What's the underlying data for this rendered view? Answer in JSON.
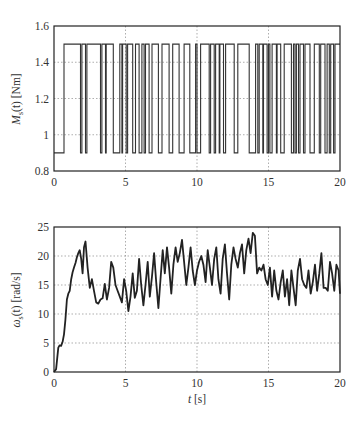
{
  "chart_data": [
    {
      "type": "line",
      "subtype": "step",
      "title": "",
      "xlabel": "",
      "ylabel": "M_s(t) [Nm]",
      "ylabel_parts": {
        "main": "M",
        "sub": "s",
        "arg": "(t)",
        "unit": " [Nm]"
      },
      "xlim": [
        0,
        20
      ],
      "ylim": [
        0.8,
        1.6
      ],
      "xticks": [
        0,
        5,
        10,
        15,
        20
      ],
      "yticks": [
        0.8,
        1,
        1.2,
        1.4,
        1.6
      ],
      "ytick_labels": [
        "0.8",
        "1",
        "1.2",
        "1.4",
        "1.6"
      ],
      "grid": true,
      "low_value": 0.9,
      "high_value": 1.5,
      "initial_value": 0.9,
      "switch_times": [
        0.7,
        1.85,
        1.95,
        2.2,
        2.3,
        3.25,
        3.35,
        3.6,
        3.65,
        4.15,
        4.6,
        4.75,
        4.8,
        5.05,
        5.15,
        5.5,
        5.7,
        5.95,
        6.15,
        6.3,
        6.4,
        6.65,
        6.85,
        7.3,
        7.55,
        8.05,
        8.3,
        8.75,
        9.1,
        9.5,
        9.9,
        10.0,
        10.25,
        10.85,
        10.95,
        11.2,
        11.3,
        11.55,
        11.6,
        11.85,
        12.0,
        12.6,
        12.85,
        13.65,
        14.1,
        14.25,
        14.35,
        14.6,
        14.65,
        14.9,
        15.0,
        15.1,
        15.25,
        15.55,
        15.6,
        15.85,
        16.1,
        16.6,
        16.75,
        16.85,
        16.95,
        17.1,
        17.2,
        17.45,
        17.55,
        17.9,
        18.2,
        18.55,
        18.65,
        18.95,
        19.1,
        19.25,
        19.35,
        19.55,
        19.65,
        20.0
      ]
    },
    {
      "type": "line",
      "title": "",
      "xlabel": "t [s]",
      "xlabel_parts": {
        "var": "t",
        "unit": " [s]"
      },
      "ylabel": "ω_s(t) [rad/s]",
      "ylabel_parts": {
        "main": "ω",
        "sub": "s",
        "arg": "(t)",
        "unit": " [rad/s]"
      },
      "xlim": [
        0,
        20
      ],
      "ylim": [
        0,
        25
      ],
      "xticks": [
        0,
        5,
        10,
        15,
        20
      ],
      "yticks": [
        0,
        5,
        10,
        15,
        20,
        25
      ],
      "ytick_labels": [
        "0",
        "5",
        "10",
        "15",
        "20",
        "25"
      ],
      "grid": true,
      "x": [
        0,
        0.15,
        0.3,
        0.4,
        0.5,
        0.6,
        0.7,
        0.8,
        0.9,
        1.0,
        1.1,
        1.2,
        1.3,
        1.4,
        1.5,
        1.6,
        1.7,
        1.8,
        1.9,
        2.0,
        2.1,
        2.2,
        2.35,
        2.5,
        2.65,
        2.8,
        2.95,
        3.1,
        3.25,
        3.4,
        3.55,
        3.7,
        3.85,
        4.0,
        4.15,
        4.3,
        4.45,
        4.6,
        4.75,
        4.9,
        5.05,
        5.2,
        5.35,
        5.5,
        5.65,
        5.8,
        5.95,
        6.1,
        6.25,
        6.4,
        6.55,
        6.7,
        6.85,
        7.0,
        7.15,
        7.3,
        7.45,
        7.6,
        7.75,
        7.9,
        8.05,
        8.2,
        8.35,
        8.5,
        8.65,
        8.8,
        8.95,
        9.1,
        9.25,
        9.4,
        9.55,
        9.7,
        9.85,
        10.0,
        10.15,
        10.3,
        10.45,
        10.6,
        10.75,
        10.9,
        11.05,
        11.2,
        11.35,
        11.5,
        11.65,
        11.8,
        11.95,
        12.1,
        12.25,
        12.4,
        12.55,
        12.7,
        12.85,
        13.0,
        13.15,
        13.3,
        13.45,
        13.6,
        13.75,
        13.9,
        14.05,
        14.2,
        14.35,
        14.5,
        14.65,
        14.8,
        14.95,
        15.1,
        15.25,
        15.4,
        15.55,
        15.7,
        15.85,
        16.0,
        16.15,
        16.3,
        16.45,
        16.6,
        16.75,
        16.9,
        17.05,
        17.2,
        17.35,
        17.5,
        17.65,
        17.8,
        17.95,
        18.1,
        18.25,
        18.4,
        18.55,
        18.7,
        18.85,
        19.0,
        19.15,
        19.3,
        19.45,
        19.6,
        19.75,
        19.9,
        20.0
      ],
      "values": [
        0,
        0.5,
        4.2,
        4.6,
        4.5,
        5.2,
        6.5,
        9.0,
        12.5,
        13.5,
        14.0,
        16.0,
        17.2,
        18.0,
        18.8,
        19.8,
        20.5,
        21.0,
        19.5,
        17.0,
        21.5,
        22.5,
        18.0,
        14.5,
        16.0,
        14.0,
        12.0,
        11.8,
        12.5,
        12.7,
        15.2,
        12.5,
        14.5,
        19.0,
        18.0,
        15.0,
        14.0,
        13.0,
        12.0,
        16.0,
        14.0,
        10.5,
        13.0,
        17.0,
        12.8,
        14.0,
        19.5,
        15.0,
        11.5,
        15.0,
        19.0,
        13.0,
        16.5,
        20.5,
        15.5,
        11.0,
        16.0,
        21.0,
        17.0,
        21.5,
        18.0,
        13.5,
        18.5,
        21.5,
        19.0,
        20.5,
        22.8,
        19.0,
        15.0,
        18.0,
        21.5,
        17.5,
        15.0,
        17.5,
        19.0,
        20.0,
        18.5,
        15.5,
        21.0,
        18.0,
        15.0,
        19.5,
        21.5,
        16.0,
        13.5,
        19.5,
        22.0,
        17.0,
        12.5,
        18.5,
        21.5,
        19.5,
        18.0,
        20.5,
        22.0,
        17.0,
        21.0,
        23.0,
        20.5,
        24.0,
        23.5,
        17.0,
        18.0,
        17.5,
        18.5,
        16.0,
        15.0,
        18.0,
        13.0,
        17.5,
        14.0,
        12.5,
        15.5,
        17.5,
        13.0,
        16.0,
        11.5,
        17.5,
        14.5,
        11.5,
        17.5,
        19.5,
        16.0,
        15.0,
        14.5,
        17.5,
        13.5,
        15.5,
        18.5,
        14.0,
        17.0,
        20.5,
        14.5,
        14.5,
        14.0,
        19.0,
        17.0,
        14.0,
        18.5,
        17.5,
        13.5,
        16.0
      ]
    }
  ]
}
